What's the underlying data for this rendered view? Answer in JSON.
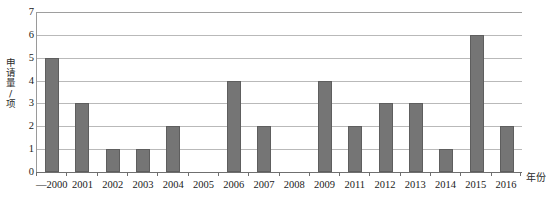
{
  "chart_data": {
    "type": "bar",
    "title": "",
    "subtitle": "",
    "xlabel": "年份",
    "ylabel": "申请量/项",
    "categories": [
      "—2000",
      "2001",
      "2002",
      "2003",
      "2004",
      "2005",
      "2006",
      "2007",
      "2008",
      "2009",
      "2011",
      "2012",
      "2013",
      "2014",
      "2015",
      "2016"
    ],
    "values": [
      5,
      3,
      1,
      1,
      2,
      0,
      4,
      2,
      0,
      4,
      2,
      3,
      3,
      1,
      6,
      2
    ],
    "ylim": [
      0,
      7
    ],
    "yticks": [
      0,
      1,
      2,
      3,
      4,
      5,
      6,
      7
    ],
    "ytick_labels": [
      "0",
      "1",
      "2",
      "3",
      "4",
      "5",
      "6",
      "7"
    ],
    "grid": true,
    "grid_axis": "y",
    "legend": false,
    "legend_position": "none",
    "bar_color": "#757575",
    "bar_edge_color": "#5e5e5e",
    "grid_color": "#b9b9b9",
    "axis_color": "#6f6f6f",
    "background_color": "#ffffff"
  }
}
